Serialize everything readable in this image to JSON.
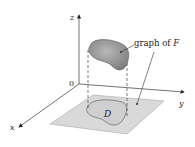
{
  "figure": {
    "axes": {
      "x_label": "x",
      "y_label": "y",
      "z_label": "z",
      "origin_label": "0"
    },
    "surface_label_prefix": "graph of ",
    "surface_label_var": "F",
    "region_label": "D",
    "colors": {
      "surface_fill": "#9a9a9a",
      "plane_fill": "#d6d6d6",
      "axis": "#333333"
    }
  }
}
